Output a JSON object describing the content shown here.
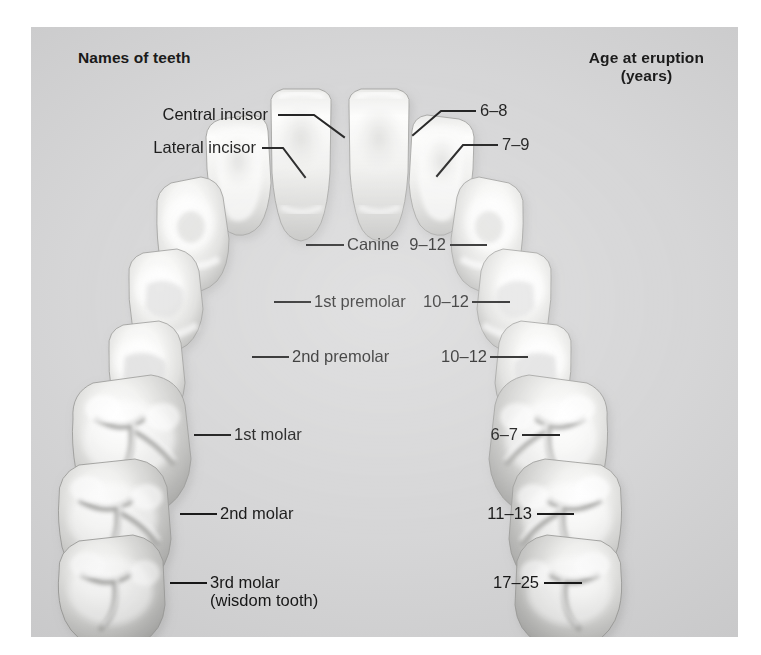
{
  "figure": {
    "title_left": "Names of teeth",
    "title_right_line1": "Age at eruption",
    "title_right_line2": "(years)",
    "background_color": "#d4d4d5",
    "page_color": "#ffffff",
    "tooth_color": "#f2f2f0",
    "line_color": "#101010"
  },
  "names": {
    "central_incisor": "Central incisor",
    "lateral_incisor": "Lateral incisor",
    "canine": "Canine",
    "premolar_1": "1st premolar",
    "premolar_2": "2nd premolar",
    "molar_1": "1st molar",
    "molar_2": "2nd molar",
    "molar_3": "3rd molar",
    "molar_3_sub": "(wisdom tooth)"
  },
  "ages": {
    "central_incisor": "6–8",
    "lateral_incisor": "7–9",
    "canine": "9–12",
    "premolar_1": "10–12",
    "premolar_2": "10–12",
    "molar_1": "6–7",
    "molar_2": "11–13",
    "molar_3": "17–25"
  },
  "teeth": [
    {
      "id": "central-incisor-left",
      "name": "Central incisor",
      "side": "left",
      "age": "6–8"
    },
    {
      "id": "central-incisor-right",
      "name": "Central incisor",
      "side": "right",
      "age": "6–8"
    },
    {
      "id": "lateral-incisor-left",
      "name": "Lateral incisor",
      "side": "left",
      "age": "7–9"
    },
    {
      "id": "lateral-incisor-right",
      "name": "Lateral incisor",
      "side": "right",
      "age": "7–9"
    },
    {
      "id": "canine-left",
      "name": "Canine",
      "side": "left",
      "age": "9–12"
    },
    {
      "id": "canine-right",
      "name": "Canine",
      "side": "right",
      "age": "9–12"
    },
    {
      "id": "premolar1-left",
      "name": "1st premolar",
      "side": "left",
      "age": "10–12"
    },
    {
      "id": "premolar1-right",
      "name": "1st premolar",
      "side": "right",
      "age": "10–12"
    },
    {
      "id": "premolar2-left",
      "name": "2nd premolar",
      "side": "left",
      "age": "10–12"
    },
    {
      "id": "premolar2-right",
      "name": "2nd premolar",
      "side": "right",
      "age": "10–12"
    },
    {
      "id": "molar1-left",
      "name": "1st molar",
      "side": "left",
      "age": "6–7"
    },
    {
      "id": "molar1-right",
      "name": "1st molar",
      "side": "right",
      "age": "6–7"
    },
    {
      "id": "molar2-left",
      "name": "2nd molar",
      "side": "left",
      "age": "11–13"
    },
    {
      "id": "molar2-right",
      "name": "2nd molar",
      "side": "right",
      "age": "11–13"
    },
    {
      "id": "molar3-left",
      "name": "3rd molar (wisdom tooth)",
      "side": "left",
      "age": "17–25"
    },
    {
      "id": "molar3-right",
      "name": "3rd molar (wisdom tooth)",
      "side": "right",
      "age": "17–25"
    }
  ]
}
